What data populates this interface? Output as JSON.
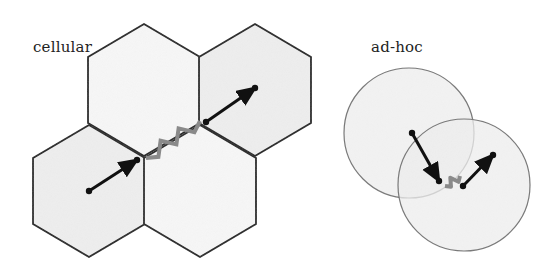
{
  "diagram": {
    "colors": {
      "fill": "#eeeeee",
      "fill_blank": "#f7f7f7",
      "stroke": "#222222",
      "circle_stroke": "#777777",
      "link": "#8a8a8a",
      "arrow": "#111111"
    },
    "panels": [
      {
        "id": "cellular",
        "label": "cellular",
        "cells": [
          {
            "name": "top-cell",
            "center": [
              144,
              90
            ],
            "shaded": false
          },
          {
            "name": "top-right-cell",
            "center": [
              255,
              90
            ],
            "shaded": true
          },
          {
            "name": "bottom-left-cell",
            "center": [
              89,
              191
            ],
            "shaded": true
          },
          {
            "name": "bottom-middle-cell",
            "center": [
              200,
              191
            ],
            "shaded": false
          }
        ],
        "arrows": [
          {
            "from": [
              89,
              191
            ],
            "to": [
              137,
              160
            ]
          },
          {
            "from": [
              206,
              122
            ],
            "to": [
              255,
              88
            ]
          }
        ],
        "wireless_link": {
          "from": [
            146,
            158
          ],
          "to": [
            200,
            121
          ]
        }
      },
      {
        "id": "ad-hoc",
        "label": "ad-hoc",
        "ranges": [
          {
            "name": "left-range",
            "center": [
              409,
              133
            ],
            "r": 65
          },
          {
            "name": "right-range",
            "center": [
              464,
              185
            ],
            "r": 66
          }
        ],
        "arrows": [
          {
            "from": [
              412,
              133
            ],
            "to": [
              439,
              181
            ]
          },
          {
            "from": [
              463,
              186
            ],
            "to": [
              493,
              155
            ]
          }
        ],
        "wireless_link": {
          "from": [
            445,
            186
          ],
          "to": [
            460,
            176
          ]
        }
      }
    ]
  }
}
